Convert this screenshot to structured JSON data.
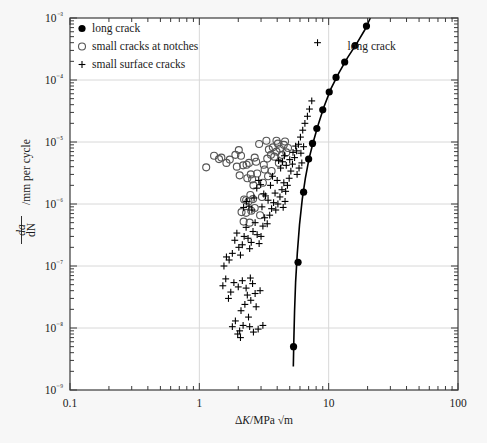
{
  "chart_data": {
    "type": "scatter",
    "title": "",
    "xlabel": "ΔK/MPa √m",
    "ylabel": "da/dN /mm per cycle",
    "xscale": "log",
    "yscale": "log",
    "xlim": [
      0.1,
      100
    ],
    "ylim": [
      1e-09,
      0.001
    ],
    "xticks": [
      "0.1",
      "1",
      "10",
      "100"
    ],
    "xtick_values": [
      0.1,
      1,
      10,
      100
    ],
    "yticks": [
      "10⁻³",
      "10⁻⁴",
      "10⁻⁵",
      "10⁻⁶",
      "10⁻⁷",
      "10⁻⁸",
      "10⁻⁹"
    ],
    "ytick_values": [
      0.001,
      0.0001,
      1e-05,
      1e-06,
      1e-07,
      1e-08,
      1e-09
    ],
    "grid": "major-decades-light-gray",
    "legend_position": "top-left-inside",
    "annotations": [
      {
        "text": "long crack",
        "x": 14.0,
        "y": 0.00031
      }
    ],
    "series": [
      {
        "name": "long crack",
        "marker": "filled-circle",
        "color": "#000000",
        "points": [
          [
            19.6,
            0.00074
          ],
          [
            16.0,
            0.00036
          ],
          [
            13.3,
            0.000195
          ],
          [
            11.4,
            0.00011
          ],
          [
            10.1,
            6.4e-05
          ],
          [
            9.0,
            3.3e-05
          ],
          [
            8.1,
            1.65e-05
          ],
          [
            7.5,
            9.5e-06
          ],
          [
            7.0,
            5.3e-06
          ],
          [
            6.4,
            1.55e-06
          ],
          [
            5.8,
            1.15e-07
          ],
          [
            5.35,
            5e-09
          ]
        ]
      },
      {
        "name": "long crack curve",
        "marker": "line",
        "color": "#000000",
        "points": [
          [
            21.0,
            0.001
          ],
          [
            19.0,
            0.00064
          ],
          [
            16.5,
            0.00039
          ],
          [
            14.0,
            0.00023
          ],
          [
            12.0,
            0.00013
          ],
          [
            10.4,
            7.2e-05
          ],
          [
            9.2,
            3.7e-05
          ],
          [
            8.3,
            1.9e-05
          ],
          [
            7.6,
            1e-05
          ],
          [
            7.05,
            5.4e-06
          ],
          [
            6.6,
            2.6e-06
          ],
          [
            6.25,
            1.2e-06
          ],
          [
            5.95,
            4.6e-07
          ],
          [
            5.72,
            1.6e-07
          ],
          [
            5.55,
            5.5e-08
          ],
          [
            5.45,
            1.9e-08
          ],
          [
            5.38,
            6.5e-09
          ],
          [
            5.33,
            2.4e-09
          ]
        ]
      },
      {
        "name": "small cracks at notches",
        "marker": "open-circle",
        "color": "#555555",
        "points": [
          [
            1.13,
            3.9e-06
          ],
          [
            1.3,
            6e-06
          ],
          [
            1.42,
            5.3e-06
          ],
          [
            1.48,
            5.6e-06
          ],
          [
            1.62,
            4.6e-06
          ],
          [
            1.72,
            5.2e-06
          ],
          [
            1.9,
            6.2e-06
          ],
          [
            2.02,
            7.4e-06
          ],
          [
            2.1,
            6e-06
          ],
          [
            2.18,
            4.2e-06
          ],
          [
            2.32,
            4.3e-06
          ],
          [
            2.42,
            4.6e-06
          ],
          [
            2.5,
            3e-06
          ],
          [
            2.56,
            2.5e-06
          ],
          [
            2.62,
            2e-06
          ],
          [
            2.48,
            1.4e-06
          ],
          [
            2.3,
            1.15e-06
          ],
          [
            2.22,
            1.18e-06
          ],
          [
            2.4,
            1.1e-06
          ],
          [
            2.6,
            1.2e-06
          ],
          [
            2.12,
            7.4e-07
          ],
          [
            2.3,
            7.2e-07
          ],
          [
            2.52,
            7.8e-07
          ],
          [
            2.68,
            8.6e-07
          ],
          [
            2.2,
            5.2e-07
          ],
          [
            2.45,
            5e-07
          ],
          [
            2.95,
            6.6e-07
          ],
          [
            3.05,
            1.3e-06
          ],
          [
            3.1,
            2.2e-06
          ],
          [
            3.2,
            3.6e-06
          ],
          [
            3.35,
            5.4e-06
          ],
          [
            3.45,
            7.6e-06
          ],
          [
            3.58,
            6.2e-06
          ],
          [
            3.7,
            8.2e-06
          ],
          [
            3.8,
            5.8e-06
          ],
          [
            3.95,
            7e-06
          ],
          [
            4.05,
            9.4e-06
          ],
          [
            4.2,
            7.8e-06
          ],
          [
            4.35,
            6.2e-06
          ],
          [
            4.5,
            9e-06
          ],
          [
            3.3,
            1.05e-05
          ],
          [
            3.95,
            1.05e-05
          ],
          [
            4.6,
            1.02e-05
          ],
          [
            2.9,
            9.3e-06
          ],
          [
            3.15,
            4.3e-06
          ],
          [
            3.4,
            2.8e-06
          ],
          [
            2.8,
            3.1e-06
          ],
          [
            2.75,
            4.8e-06
          ],
          [
            1.95,
            4e-06
          ],
          [
            2.05,
            2.9e-06
          ],
          [
            4.7,
            6.8e-06
          ],
          [
            4.85,
            8e-06
          ],
          [
            2.35,
            2.6e-06
          ],
          [
            2.68,
            5.6e-06
          ],
          [
            3.62,
            3.4e-06
          ],
          [
            4.12,
            4.6e-06
          ]
        ]
      },
      {
        "name": "small surface cracks",
        "marker": "plus",
        "color": "#000000",
        "points": [
          [
            1.55,
            1e-07
          ],
          [
            1.62,
            1.4e-07
          ],
          [
            1.7,
            1.25e-07
          ],
          [
            1.8,
            1.6e-07
          ],
          [
            1.88,
            2.6e-07
          ],
          [
            1.95,
            3.4e-07
          ],
          [
            2.02,
            2e-07
          ],
          [
            2.08,
            1.5e-07
          ],
          [
            2.15,
            2.2e-07
          ],
          [
            2.22,
            3e-07
          ],
          [
            2.3,
            4.2e-07
          ],
          [
            2.38,
            2.8e-07
          ],
          [
            2.45,
            1.9e-07
          ],
          [
            2.52,
            2.4e-07
          ],
          [
            2.6,
            3.6e-07
          ],
          [
            2.7,
            5e-07
          ],
          [
            2.8,
            3.2e-07
          ],
          [
            2.9,
            2.3e-07
          ],
          [
            3.0,
            3e-07
          ],
          [
            3.1,
            4.4e-07
          ],
          [
            3.2,
            6e-07
          ],
          [
            3.35,
            4.8e-07
          ],
          [
            3.5,
            6.6e-07
          ],
          [
            3.62,
            8.4e-07
          ],
          [
            3.75,
            1.05e-06
          ],
          [
            3.9,
            8e-07
          ],
          [
            4.05,
            1e-06
          ],
          [
            4.2,
            1.3e-06
          ],
          [
            4.35,
            1.7e-06
          ],
          [
            4.5,
            2.2e-06
          ],
          [
            4.65,
            1.6e-06
          ],
          [
            4.8,
            2e-06
          ],
          [
            4.95,
            2.6e-06
          ],
          [
            5.1,
            3.4e-06
          ],
          [
            5.25,
            4.4e-06
          ],
          [
            5.45,
            5.6e-06
          ],
          [
            5.65,
            7.2e-06
          ],
          [
            5.85,
            9.2e-06
          ],
          [
            6.05,
            1.2e-05
          ],
          [
            6.3,
            1.55e-05
          ],
          [
            6.55,
            2e-05
          ],
          [
            6.85,
            2.6e-05
          ],
          [
            2.48,
            6.4e-08
          ],
          [
            2.58,
            5.2e-08
          ],
          [
            2.3,
            4.4e-08
          ],
          [
            2.15,
            5.8e-08
          ],
          [
            2.0,
            4.6e-08
          ],
          [
            1.85,
            5.4e-08
          ],
          [
            1.75,
            3.8e-08
          ],
          [
            1.68,
            3e-08
          ],
          [
            2.7,
            3.6e-08
          ],
          [
            2.95,
            4e-08
          ],
          [
            2.25,
            2.4e-08
          ],
          [
            2.1,
            1.9e-08
          ],
          [
            2.4,
            1.5e-08
          ],
          [
            2.05,
            9e-09
          ],
          [
            2.08,
            7e-09
          ],
          [
            1.98,
            8e-09
          ],
          [
            2.62,
            8.6e-09
          ],
          [
            2.85,
            9.6e-09
          ],
          [
            3.25,
            1.35e-06
          ],
          [
            3.4,
            1.15e-06
          ],
          [
            2.55,
            8e-07
          ],
          [
            2.42,
            9.2e-07
          ],
          [
            2.32,
            1.1e-06
          ],
          [
            2.2,
            8.8e-07
          ],
          [
            3.05,
            9e-07
          ],
          [
            3.15,
            1.45e-06
          ],
          [
            4.1,
            5e-06
          ],
          [
            4.25,
            3.8e-06
          ],
          [
            4.4,
            4.8e-06
          ],
          [
            4.55,
            6e-06
          ],
          [
            4.7,
            4.2e-06
          ],
          [
            5.0,
            5.2e-06
          ],
          [
            5.3,
            6.8e-06
          ],
          [
            5.55,
            8.6e-06
          ],
          [
            6.1,
            6.6e-06
          ],
          [
            6.4,
            8.4e-06
          ],
          [
            7.1,
            3.4e-05
          ],
          [
            7.4,
            4.6e-05
          ],
          [
            2.78,
            1.8e-06
          ],
          [
            2.88,
            2.4e-06
          ],
          [
            3.55,
            2e-06
          ],
          [
            3.68,
            2.8e-06
          ],
          [
            1.6,
            6.2e-08
          ],
          [
            1.52,
            4.8e-08
          ],
          [
            2.65,
            1.25e-06
          ],
          [
            2.98,
            2.05e-06
          ],
          [
            8.2,
            0.0004
          ],
          [
            5.7,
            3e-06
          ],
          [
            5.9,
            3.8e-06
          ],
          [
            6.2,
            4.6e-06
          ],
          [
            4.45,
            8.8e-07
          ],
          [
            4.6,
            1.1e-06
          ],
          [
            3.85,
            1.5e-06
          ],
          [
            4.0,
            2.4e-06
          ],
          [
            2.35,
            3.4e-08
          ],
          [
            2.5,
            2.8e-08
          ],
          [
            2.75,
            2.2e-08
          ],
          [
            1.9,
            1.3e-08
          ],
          [
            2.18,
            1.1e-08
          ],
          [
            2.45,
            1.05e-08
          ],
          [
            1.8,
            1.05e-08
          ],
          [
            3.1,
            1.1e-08
          ]
        ]
      }
    ]
  },
  "legend": {
    "items": [
      {
        "marker": "filled-circle",
        "label": "long crack"
      },
      {
        "marker": "open-circle",
        "label": "small cracks at notches"
      },
      {
        "marker": "plus",
        "label": "small surface cracks"
      }
    ]
  },
  "axes": {
    "y_axis_numerator": "da",
    "y_axis_denominator": "dN",
    "y_axis_suffix": "/mm per cycle",
    "x_axis_delta": "Δ",
    "x_axis_k": "K",
    "x_axis_units": "/MPa √m"
  },
  "colors": {
    "background": "#f7f7f7",
    "plot_background": "#ffffff",
    "axis": "#3a3a3a",
    "grid": "#d8d8d8",
    "marker_dark": "#000000",
    "marker_open": "#555555"
  }
}
